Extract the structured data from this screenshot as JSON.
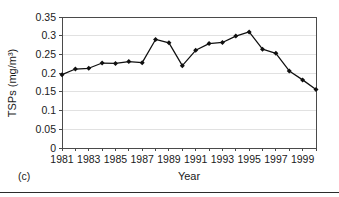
{
  "panel": {
    "label": "(c)"
  },
  "chart_data": {
    "type": "line",
    "title": "",
    "xlabel": "Year",
    "ylabel": "TSPs (mg/m3)",
    "ylabel_display": "TSPs (mg/m³)",
    "x": [
      1981,
      1982,
      1983,
      1984,
      1985,
      1986,
      1987,
      1988,
      1989,
      1990,
      1991,
      1992,
      1993,
      1994,
      1995,
      1996,
      1997,
      1998,
      1999,
      2000
    ],
    "values": [
      0.196,
      0.211,
      0.213,
      0.227,
      0.226,
      0.231,
      0.228,
      0.29,
      0.281,
      0.22,
      0.261,
      0.279,
      0.282,
      0.299,
      0.31,
      0.264,
      0.253,
      0.206,
      0.182,
      0.156
    ],
    "series": [
      {
        "name": "TSPs",
        "values": [
          0.196,
          0.211,
          0.213,
          0.227,
          0.226,
          0.231,
          0.228,
          0.29,
          0.281,
          0.22,
          0.261,
          0.279,
          0.282,
          0.299,
          0.31,
          0.264,
          0.253,
          0.206,
          0.182,
          0.156
        ]
      }
    ],
    "xlim": [
      1981,
      2000
    ],
    "ylim": [
      0,
      0.35
    ],
    "ytick_values": [
      0,
      0.05,
      0.1,
      0.15,
      0.2,
      0.25,
      0.3,
      0.35
    ],
    "ytick_labels": [
      "0",
      "0.05",
      "0.1",
      "0.15",
      "0.2",
      "0.25",
      "0.3",
      "0.35"
    ],
    "xtick_values": [
      1981,
      1982,
      1983,
      1984,
      1985,
      1986,
      1987,
      1988,
      1989,
      1990,
      1991,
      1992,
      1993,
      1994,
      1995,
      1996,
      1997,
      1998,
      1999,
      2000
    ],
    "xtick_labeled": [
      1981,
      1983,
      1985,
      1987,
      1989,
      1991,
      1993,
      1995,
      1997,
      1999
    ],
    "xtick_labels": [
      "1981",
      "1983",
      "1985",
      "1987",
      "1989",
      "1991",
      "1993",
      "1995",
      "1997",
      "1999"
    ],
    "grid": "horizontal",
    "legend": "none",
    "marker": "diamond",
    "line_color": "#101010",
    "marker_color": "#101010",
    "grid_color": "#d9d9d9",
    "axis_color": "#4a4a4a"
  }
}
